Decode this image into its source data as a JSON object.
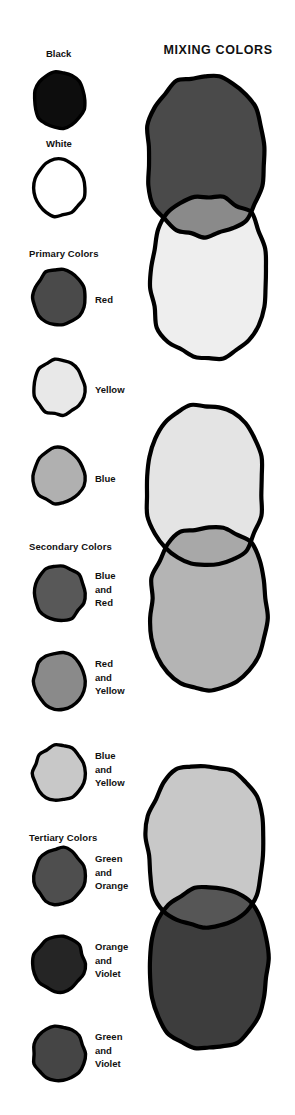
{
  "page": {
    "title": "Mixing Colors",
    "width": 295,
    "height": 1115,
    "background": "#ffffff",
    "ink": "#000000"
  },
  "right_column": {
    "title": "MIXING COLORS"
  },
  "left_column": {
    "sections": [
      {
        "heading": null,
        "heading_y": null
      },
      {
        "heading": "Primary Colors",
        "heading_y": 248
      },
      {
        "heading": "Secondary Colors",
        "heading_y": 541
      },
      {
        "heading": "Tertiary Colors",
        "heading_y": 832
      }
    ],
    "headings": {
      "primary": "Primary Colors",
      "secondary": "Secondary Colors",
      "tertiary": "Tertiary Colors"
    },
    "swatches": [
      {
        "name": "black",
        "label": "Black",
        "label_lines": [
          "Black"
        ],
        "fill": "#0d0d0d",
        "stroke": "#000000",
        "label_position": "above",
        "label_x": 46,
        "label_y": 47,
        "circle_x": 29,
        "circle_y": 68
      },
      {
        "name": "white",
        "label": "White",
        "label_lines": [
          "White"
        ],
        "fill": "#ffffff",
        "stroke": "#000000",
        "label_position": "above",
        "label_x": 46,
        "label_y": 137,
        "circle_x": 29,
        "circle_y": 156
      },
      {
        "name": "red",
        "label": "Red",
        "label_lines": [
          "Red"
        ],
        "fill": "#4a4a4a",
        "stroke": "#000000",
        "label_position": "right",
        "label_x": 95,
        "label_y": 293,
        "circle_x": 29,
        "circle_y": 265
      },
      {
        "name": "yellow",
        "label": "Yellow",
        "label_lines": [
          "Yellow"
        ],
        "fill": "#e8e8e8",
        "stroke": "#000000",
        "label_position": "right",
        "label_x": 95,
        "label_y": 383,
        "circle_x": 29,
        "circle_y": 355
      },
      {
        "name": "blue",
        "label": "Blue",
        "label_lines": [
          "Blue"
        ],
        "fill": "#b0b0b0",
        "stroke": "#000000",
        "label_position": "right",
        "label_x": 95,
        "label_y": 472,
        "circle_x": 29,
        "circle_y": 444
      },
      {
        "name": "blue-and-red",
        "label": "Blue and Red",
        "label_lines": [
          "Blue",
          "and",
          "Red"
        ],
        "fill": "#585858",
        "stroke": "#000000",
        "label_position": "right",
        "label_x": 95,
        "label_y": 569,
        "circle_x": 29,
        "circle_y": 561
      },
      {
        "name": "red-and-yellow",
        "label": "Red and Yellow",
        "label_lines": [
          "Red",
          "and",
          "Yellow"
        ],
        "fill": "#8a8a8a",
        "stroke": "#000000",
        "label_position": "right",
        "label_x": 95,
        "label_y": 657,
        "circle_x": 29,
        "circle_y": 649
      },
      {
        "name": "blue-and-yellow",
        "label": "Blue and Yellow",
        "label_lines": [
          "Blue",
          "and",
          "Yellow"
        ],
        "fill": "#c8c8c8",
        "stroke": "#000000",
        "label_position": "right",
        "label_x": 95,
        "label_y": 749,
        "circle_x": 29,
        "circle_y": 741
      },
      {
        "name": "green-and-orange",
        "label": "Green and Orange",
        "label_lines": [
          "Green",
          "and",
          "Orange"
        ],
        "fill": "#4e4e4e",
        "stroke": "#000000",
        "label_position": "right",
        "label_x": 95,
        "label_y": 852,
        "circle_x": 29,
        "circle_y": 844
      },
      {
        "name": "orange-and-violet",
        "label": "Orange and Violet",
        "label_lines": [
          "Orange",
          "and",
          "Violet"
        ],
        "fill": "#252525",
        "stroke": "#000000",
        "label_position": "right",
        "label_x": 95,
        "label_y": 940,
        "circle_x": 29,
        "circle_y": 932
      },
      {
        "name": "green-and-violet",
        "label": "Green and Violet",
        "label_lines": [
          "Green",
          "and",
          "Violet"
        ],
        "fill": "#454545",
        "stroke": "#000000",
        "label_position": "right",
        "label_x": 95,
        "label_y": 1030,
        "circle_x": 29,
        "circle_y": 1022
      }
    ]
  },
  "mixing_diagrams": [
    {
      "name": "red-yellow-orange",
      "top_y": 70,
      "upper_color": "#4a4a4a",
      "upper_meaning": "Red",
      "lower_color": "#eeeeee",
      "lower_meaning": "Yellow",
      "overlap_color": "#8a8a8a",
      "overlap_meaning": "Orange"
    },
    {
      "name": "yellow-blue-green",
      "top_y": 400,
      "upper_color": "#e4e4e4",
      "upper_meaning": "Yellow",
      "lower_color": "#b4b4b4",
      "lower_meaning": "Blue",
      "overlap_color": "#a8a8a8",
      "overlap_meaning": "Green"
    },
    {
      "name": "green-violet-mix",
      "top_y": 760,
      "upper_color": "#c8c8c8",
      "upper_meaning": "Green",
      "lower_color": "#3d3d3d",
      "lower_meaning": "Violet",
      "overlap_color": "#565656",
      "overlap_meaning": "Green and Violet"
    }
  ]
}
